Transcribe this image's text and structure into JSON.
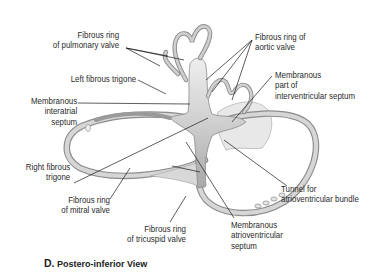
{
  "figure": {
    "caption_letter": "D.",
    "caption_text": "Postero-inferior View"
  },
  "labels": {
    "pulmonary_ring": [
      "Fibrous ring",
      "of pulmonary valve"
    ],
    "left_trigone": [
      "Left fibrous trigone"
    ],
    "interatrial": [
      "Membranous",
      "interatrial",
      "septum"
    ],
    "right_trigone": [
      "Right fibrous",
      "trigone"
    ],
    "mitral_ring": [
      "Fibrous ring",
      "of mitral valve"
    ],
    "tricuspid_ring": [
      "Fibrous ring",
      "of tricuspid valve"
    ],
    "aortic_ring": [
      "Fibrous ring of",
      "aortic valve"
    ],
    "interventricular": [
      "Membranous",
      "part of",
      "interventricular septum"
    ],
    "tunnel": [
      "Tunnel for",
      "atrioventricular bundle"
    ],
    "av_septum": [
      "Membranous",
      "atrioventricular",
      "septum"
    ]
  },
  "colors": {
    "ring_fill": "#d4d4d4",
    "ring_edge": "#8a8a8a",
    "septum_fill": "#e6e6e6",
    "leader": "#1a1a1a"
  }
}
